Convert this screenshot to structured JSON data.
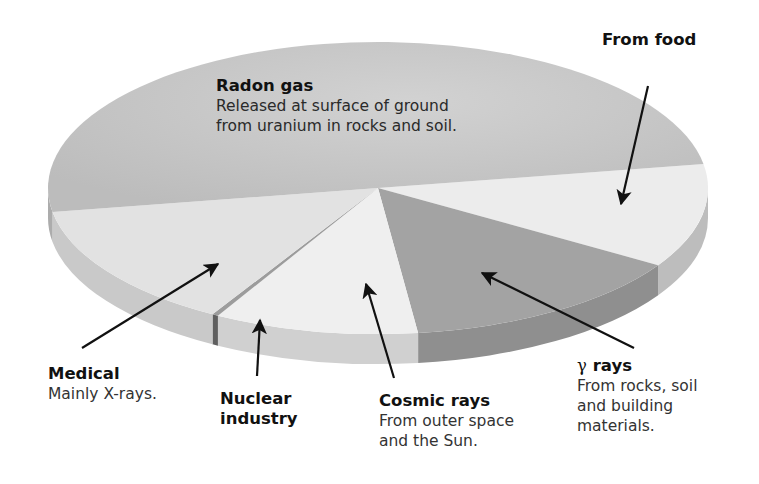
{
  "chart_data": {
    "type": "pie",
    "style": "3d-exploded-perspective",
    "title": "",
    "unit": "share of background radiation",
    "slices": [
      {
        "key": "radon",
        "label": "Radon gas",
        "description": "Released at surface of ground\nfrom uranium in rocks and soil.",
        "value": 50.0,
        "top_color": "#c4c4c4",
        "side_color": "#acacac"
      },
      {
        "key": "food",
        "label": "From food",
        "description": "",
        "value": 11.5,
        "top_color": "#ececec",
        "side_color": "#bdbdbd"
      },
      {
        "key": "gamma",
        "label": "γ rays",
        "description": "From rocks, soil\nand building\nmaterials.",
        "value": 14.2,
        "top_color": "#a3a3a3",
        "side_color": "#8f8f8f"
      },
      {
        "key": "cosmic",
        "label": "Cosmic rays",
        "description": "From outer space\nand the Sun.",
        "value": 10.0,
        "top_color": "#efefef",
        "side_color": "#d0d0d0"
      },
      {
        "key": "nuclear",
        "label": "Nuclear industry",
        "description": "",
        "value": 0.3,
        "top_color": "#9c9c9c",
        "side_color": "#5f5f5f"
      },
      {
        "key": "medical",
        "label": "Medical",
        "description": "Mainly X-rays.",
        "value": 14.0,
        "top_color": "#e2e2e2",
        "side_color": "#c9c9c9"
      }
    ],
    "legend": "none (callout labels with arrows)",
    "grid": false
  },
  "labels": {
    "radon": {
      "title": "Radon gas",
      "desc": "Released at surface of ground\nfrom uranium in rocks and soil."
    },
    "food": {
      "title": "From food"
    },
    "medical": {
      "title": "Medical",
      "desc": "Mainly X-rays."
    },
    "nuclear": {
      "title_line1": "Nuclear",
      "title_line2": "industry"
    },
    "cosmic": {
      "title": "Cosmic rays",
      "desc": "From outer space\nand the Sun."
    },
    "gamma": {
      "symbol": "γ",
      "title": "rays",
      "desc": "From rocks, soil\nand building\nmaterials."
    }
  }
}
